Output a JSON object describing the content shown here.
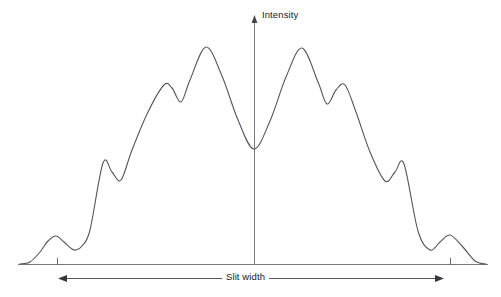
{
  "figure": {
    "title": "",
    "y_axis_label": "Intensity",
    "x_axis_label": "Slit width",
    "line_color": "#55555a",
    "axis_color": "#6a6a70",
    "background_color": "#ffffff"
  },
  "chart_data": {
    "type": "line",
    "title": "",
    "xlabel": "Slit width",
    "ylabel": "Intensity",
    "grid": false,
    "legend": null,
    "xlim": [
      18,
      488
    ],
    "ylim": [
      264,
      47
    ],
    "axes": {
      "y_axis": {
        "x": 254,
        "y_top": 16,
        "y_bottom": 264,
        "arrow": "up"
      },
      "x_axis": {
        "y": 264,
        "x_left": 18,
        "x_right": 488,
        "arrow": "none"
      },
      "ticks": [
        {
          "x": 57,
          "y": 264,
          "length": 7
        },
        {
          "x": 450,
          "y": 264,
          "length": 7
        }
      ],
      "dimension_arrow": {
        "y": 278,
        "x_left": 59,
        "x_right": 443,
        "arrows": "both",
        "label": "Slit width"
      }
    },
    "features": {
      "center_x": 254,
      "baseline_y": 264,
      "central_minimum": {
        "x": 254,
        "y": 149
      },
      "peaks_left": [
        {
          "name": "outer-side-lobe-left",
          "x": 56,
          "y": 236
        },
        {
          "name": "second-lobe-left",
          "x": 103,
          "y": 163
        },
        {
          "name": "third-lobe-left",
          "x": 164,
          "y": 85
        },
        {
          "name": "principal-maximum-left",
          "x": 206,
          "y": 47
        }
      ],
      "minima_left": [
        {
          "x": 76,
          "y": 250
        },
        {
          "x": 121,
          "y": 180
        },
        {
          "x": 181,
          "y": 102
        }
      ],
      "peaks_right": [
        {
          "name": "principal-maximum-right",
          "x": 302,
          "y": 48
        },
        {
          "name": "third-lobe-right",
          "x": 345,
          "y": 85
        },
        {
          "name": "second-lobe-right",
          "x": 404,
          "y": 164
        },
        {
          "name": "outer-side-lobe-right",
          "x": 450,
          "y": 235
        }
      ],
      "minima_right": [
        {
          "x": 327,
          "y": 104
        },
        {
          "x": 385,
          "y": 181
        },
        {
          "x": 430,
          "y": 250
        }
      ],
      "tail_left_start": {
        "x": 20,
        "y": 264
      },
      "tail_right_end": {
        "x": 486,
        "y": 264
      }
    },
    "x": [
      20,
      30,
      40,
      48,
      56,
      64,
      72,
      76,
      82,
      90,
      103,
      112,
      121,
      132,
      148,
      164,
      172,
      181,
      190,
      206,
      222,
      238,
      254,
      270,
      286,
      302,
      318,
      327,
      336,
      345,
      356,
      370,
      385,
      395,
      404,
      418,
      430,
      440,
      450,
      462,
      475,
      486
    ],
    "y": [
      264,
      262,
      252,
      241,
      236,
      242,
      249,
      250,
      246,
      230,
      163,
      172,
      180,
      150,
      112,
      85,
      88,
      102,
      80,
      47,
      76,
      120,
      149,
      121,
      77,
      48,
      82,
      104,
      90,
      85,
      112,
      152,
      181,
      172,
      164,
      231,
      250,
      242,
      235,
      246,
      261,
      264
    ]
  }
}
